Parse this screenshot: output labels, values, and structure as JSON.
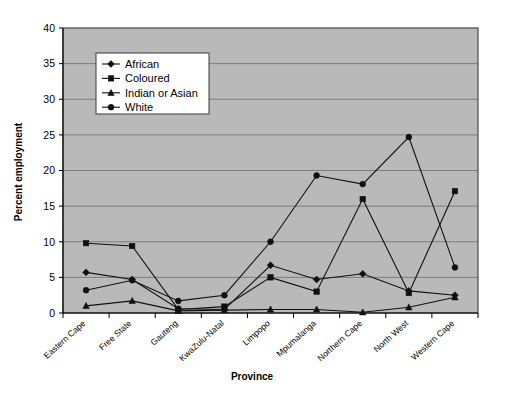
{
  "chart_data": {
    "type": "line",
    "title": "",
    "xlabel": "Province",
    "ylabel": "Percent employment",
    "categories": [
      "Eastern Cape",
      "Free State",
      "Gauteng",
      "KwaZulu-Natal",
      "Limpopo",
      "Mpumalanga",
      "Northern Cape",
      "North West",
      "Western Cape"
    ],
    "ylim": [
      0,
      40
    ],
    "yticks": [
      0,
      5,
      10,
      15,
      20,
      25,
      30,
      35,
      40
    ],
    "grid": true,
    "legend_position": "upper-left-inside",
    "series": [
      {
        "name": "African",
        "marker": "diamond",
        "values": [
          5.7,
          4.7,
          0.6,
          0.5,
          6.7,
          4.7,
          5.5,
          3.1,
          2.5
        ]
      },
      {
        "name": "Coloured",
        "marker": "square",
        "values": [
          9.8,
          9.4,
          0.5,
          0.9,
          5.0,
          3.0,
          16.0,
          2.8,
          17.1
        ]
      },
      {
        "name": "Indian or Asian",
        "marker": "triangle",
        "values": [
          1.0,
          1.7,
          0.3,
          0.4,
          0.5,
          0.5,
          0.1,
          0.8,
          2.2
        ]
      },
      {
        "name": "White",
        "marker": "circle",
        "values": [
          3.2,
          4.6,
          1.7,
          2.5,
          10.0,
          19.3,
          18.1,
          24.7,
          6.4
        ]
      }
    ],
    "white_series_note": "",
    "ytick_labels": [
      "0",
      "5",
      "10",
      "15",
      "20",
      "25",
      "30",
      "35",
      "40"
    ]
  },
  "legend": {
    "items": [
      {
        "label": "African"
      },
      {
        "label": "Coloured"
      },
      {
        "label": "Indian or Asian"
      },
      {
        "label": "White"
      }
    ]
  }
}
